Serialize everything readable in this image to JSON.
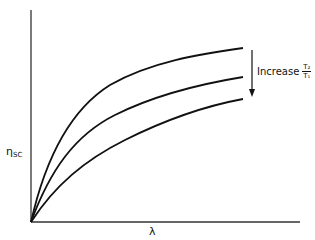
{
  "diagram": {
    "y_axis_label": "η",
    "y_axis_label_sub": "SC",
    "x_axis_label": "λ",
    "annotation": {
      "text": "Increase",
      "fraction_numerator": "T₂",
      "fraction_denominator": "T₁",
      "arrow_direction": "down"
    },
    "curves": [
      {
        "name": "curve-top",
        "description": "highest efficiency curve"
      },
      {
        "name": "curve-middle",
        "description": "middle efficiency curve"
      },
      {
        "name": "curve-bottom",
        "description": "lowest efficiency curve"
      }
    ],
    "colors": {
      "line": "#111111",
      "axis": "#333333",
      "background": "#ffffff"
    }
  }
}
